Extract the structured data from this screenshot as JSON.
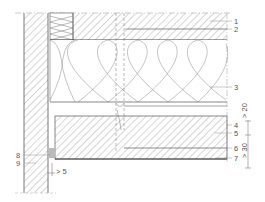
{
  "diagram": {
    "type": "construction-section-detail",
    "colors": {
      "line": "#555555",
      "hatch": "#8a8a8a",
      "leader": "#777777",
      "background": "#ffffff"
    },
    "callouts": [
      {
        "id": "1",
        "label": "1"
      },
      {
        "id": "2",
        "label": "2"
      },
      {
        "id": "3",
        "label": "3"
      },
      {
        "id": "4",
        "label": "4"
      },
      {
        "id": "5",
        "label": "5"
      },
      {
        "id": "6",
        "label": "6"
      },
      {
        "id": "7",
        "label": "7"
      },
      {
        "id": "8",
        "label": "8"
      },
      {
        "id": "9",
        "label": "9"
      }
    ],
    "dimensions": {
      "upper": "> 20",
      "lower": "> 30",
      "gap": "> 5"
    }
  }
}
